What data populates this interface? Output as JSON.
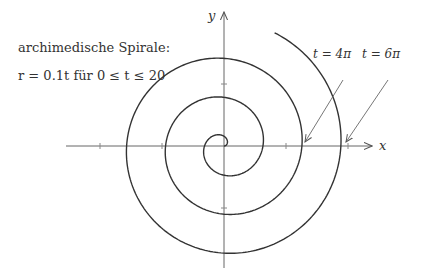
{
  "title": "archimedische Spirale:",
  "formula": "r = 0.1t für 0 ≤ t ≤ 20",
  "axes": {
    "x_label": "x",
    "y_label": "y"
  },
  "annotations": [
    {
      "label": "t = 4π",
      "t": 12.566
    },
    {
      "label": "t = 6π",
      "t": 18.85
    }
  ],
  "chart_data": {
    "type": "line",
    "title": "archimedische Spirale",
    "equation": "r = 0.1 t",
    "t_range": [
      0,
      20
    ],
    "xlabel": "x",
    "ylabel": "y",
    "xlim": [
      -2.5,
      2.5
    ],
    "ylim": [
      -2.1,
      2.2
    ],
    "ticks": {
      "x": [
        -2,
        -1,
        1,
        2
      ],
      "y": [
        -1,
        1
      ]
    },
    "annotations": [
      "t = 4π",
      "t = 6π"
    ],
    "grid": false,
    "colors": {
      "curve": "#333333",
      "axes": "#555555"
    }
  }
}
